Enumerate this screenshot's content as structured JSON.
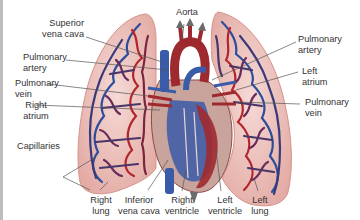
{
  "diagram": {
    "colors": {
      "lung_fill": "#f0c9c4",
      "lung_edge": "#d99c95",
      "vessel_red": "#b3242c",
      "vessel_blue": "#2b4d9c",
      "heart_red": "#9e2a2f",
      "heart_blue": "#3a5ba8",
      "leader_line": "#555555"
    },
    "labels": {
      "superior_vena_cava": [
        "Superior",
        "vena cava"
      ],
      "aorta": "Aorta",
      "pulmonary_artery_left": [
        "Pulmonary",
        "artery"
      ],
      "pulmonary_vein_left": [
        "Pulmonary",
        "vein"
      ],
      "right_atrium": [
        "Right",
        "atrium"
      ],
      "capillaries": "Capillaries",
      "pulmonary_artery_right": [
        "Pulmonary",
        "artery"
      ],
      "left_atrium": [
        "Left",
        "atrium"
      ],
      "pulmonary_vein_right": [
        "Pulmonary",
        "vein"
      ],
      "right_lung": [
        "Right",
        "lung"
      ],
      "inferior_vena_cava": [
        "Inferior",
        "vena cava"
      ],
      "right_ventricle": [
        "Right",
        "ventricle"
      ],
      "left_ventricle": [
        "Left",
        "ventricle"
      ],
      "left_lung": [
        "Left",
        "lung"
      ]
    }
  }
}
